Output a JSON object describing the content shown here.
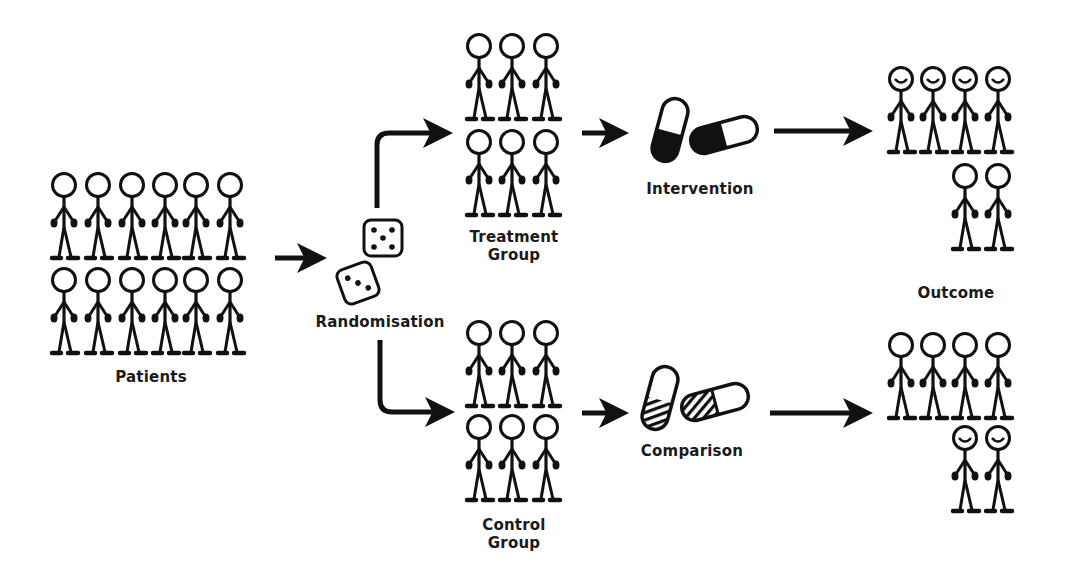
{
  "diagram": {
    "colors": {
      "ink": "#111111",
      "background": "#ffffff"
    },
    "stages": {
      "patients": {
        "label": "Patients",
        "count": 12,
        "rows": 2,
        "cols": 6
      },
      "randomisation": {
        "label": "Randomisation",
        "icon": "dice-icon",
        "dice_faces": [
          5,
          3
        ]
      },
      "treatment_group": {
        "label_line1": "Treatment",
        "label_line2": "Group",
        "count": 6
      },
      "control_group": {
        "label_line1": "Control",
        "label_line2": "Group",
        "count": 6
      },
      "intervention": {
        "label": "Intervention",
        "icon": "pill-solid-icon"
      },
      "comparison": {
        "label": "Comparison",
        "icon": "pill-striped-icon"
      },
      "outcome": {
        "label": "Outcome",
        "treatment": {
          "total": 6,
          "happy": 4,
          "neutral": 2
        },
        "control": {
          "total": 6,
          "happy": 2,
          "neutral": 4
        }
      }
    }
  }
}
